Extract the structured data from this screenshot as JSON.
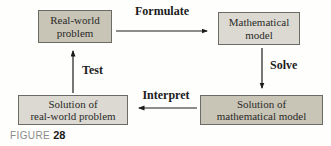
{
  "figure_caption": {
    "label": "FIGURE",
    "number": "28"
  },
  "nodes": {
    "real_world_problem": {
      "line1": "Real-world",
      "line2": "problem",
      "shade": "dark"
    },
    "mathematical_model": {
      "line1": "Mathematical",
      "line2": "model",
      "shade": "light"
    },
    "solution_real_world": {
      "line1": "Solution of",
      "line2": "real-world problem",
      "shade": "light"
    },
    "solution_mathematical": {
      "line1": "Solution of",
      "line2": "mathematical model",
      "shade": "dark"
    }
  },
  "arrows": {
    "formulate": {
      "label": "Formulate",
      "direction": "right"
    },
    "solve": {
      "label": "Solve",
      "direction": "down"
    },
    "interpret": {
      "label": "Interpret",
      "direction": "left"
    },
    "test": {
      "label": "Test",
      "direction": "up"
    }
  },
  "colors": {
    "box_fill_dark": "#c8c4b6",
    "box_fill_light": "#dbd9d1",
    "box_border": "#6b6b66",
    "arrow": "#1c1c1c",
    "caption_label": "#8b8b89",
    "caption_number": "#1a1a1a",
    "text": "#2a2a28",
    "background": "#fefefd"
  }
}
